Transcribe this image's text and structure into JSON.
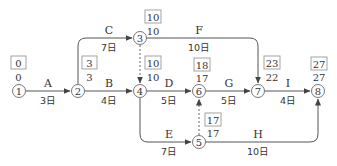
{
  "colors": {
    "line": "#555555",
    "text": "#333333",
    "box": "#999999",
    "dashed": "#666666"
  },
  "nodes": [
    {
      "id": "1",
      "x": 19,
      "y": 91,
      "ls": "0",
      "es": "0"
    },
    {
      "id": "2",
      "x": 78,
      "y": 91,
      "ls": "3",
      "es": "3"
    },
    {
      "id": "3",
      "x": 140,
      "y": 38,
      "ls": "10",
      "es": "10"
    },
    {
      "id": "4",
      "x": 140,
      "y": 91,
      "ls": "10",
      "es": "10"
    },
    {
      "id": "5",
      "x": 199,
      "y": 142,
      "ls": "17",
      "es": "17"
    },
    {
      "id": "6",
      "x": 199,
      "y": 91,
      "ls": "18",
      "es": "17"
    },
    {
      "id": "7",
      "x": 258,
      "y": 91,
      "ls": "23",
      "es": "22"
    },
    {
      "id": "8",
      "x": 318,
      "y": 91,
      "ls": "27",
      "es": "27"
    }
  ],
  "activities": [
    {
      "name": "A",
      "duration": "3日",
      "from": "1",
      "to": "2"
    },
    {
      "name": "B",
      "duration": "4日",
      "from": "2",
      "to": "4"
    },
    {
      "name": "C",
      "duration": "7日",
      "from": "2",
      "to": "3"
    },
    {
      "name": "D",
      "duration": "5日",
      "from": "4",
      "to": "6"
    },
    {
      "name": "E",
      "duration": "7日",
      "from": "4",
      "to": "5"
    },
    {
      "name": "F",
      "duration": "10日",
      "from": "3",
      "to": "7"
    },
    {
      "name": "G",
      "duration": "5日",
      "from": "6",
      "to": "7"
    },
    {
      "name": "H",
      "duration": "10日",
      "from": "5",
      "to": "8"
    },
    {
      "name": "I",
      "duration": "4日",
      "from": "7",
      "to": "8"
    }
  ],
  "dummies": [
    {
      "from": "3",
      "to": "4"
    },
    {
      "from": "5",
      "to": "6"
    }
  ]
}
